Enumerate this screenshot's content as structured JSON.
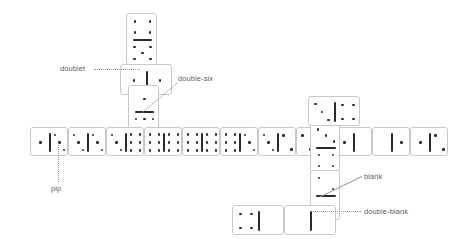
{
  "figure": {
    "background_color": "#ffffff",
    "tile_face_color": "#ffffff",
    "tile_border_color": "#c9c9c9",
    "pip_color": "#2b2b2b",
    "label_color": "#5c5c5c",
    "leader_color": "#9a9a9a"
  },
  "labels": [
    {
      "id": "doublet",
      "text": "doublet",
      "x": 60,
      "y": 64,
      "leader": {
        "x": 94,
        "y": 69,
        "length": 46,
        "angle": 0,
        "style": "dotted"
      }
    },
    {
      "id": "double-six",
      "text": "double-six",
      "x": 178,
      "y": 74,
      "leader": {
        "x": 177,
        "y": 84,
        "length": 46,
        "angle": 140,
        "style": "dotted"
      }
    },
    {
      "id": "pip",
      "text": "pip",
      "x": 51,
      "y": 184,
      "leader": {
        "x": 59,
        "y": 143,
        "length": 39,
        "angle": 90,
        "style": "dotted"
      }
    },
    {
      "id": "blank",
      "text": "blank",
      "x": 364,
      "y": 172,
      "leader": {
        "x": 362,
        "y": 177,
        "length": 47,
        "angle": 154,
        "style": "solid"
      }
    },
    {
      "id": "double-blank",
      "text": "double-blank",
      "x": 364,
      "y": 207,
      "leader": {
        "x": 361,
        "y": 212,
        "length": 48,
        "angle": 180,
        "style": "dotted"
      }
    }
  ],
  "tiles": [
    {
      "id": "t-top-4-5",
      "name": "tile-vertical-four-five",
      "orientation": "vertical",
      "x": 126,
      "y": 13,
      "w": 31,
      "h": 52,
      "a": 4,
      "b": 5
    },
    {
      "id": "t-doublet-1-1",
      "name": "tile-doublet-one-one",
      "orientation": "horizontal",
      "x": 120,
      "y": 64,
      "w": 52,
      "h": 31,
      "a": 1,
      "b": 1
    },
    {
      "id": "t-six-six-v",
      "name": "tile-vertical-double-six",
      "orientation": "vertical",
      "x": 128,
      "y": 85,
      "w": 31,
      "h": 52,
      "a": 1,
      "b": 6
    },
    {
      "id": "t-row-1-3",
      "name": "tile-row-one-three",
      "orientation": "horizontal",
      "x": 30,
      "y": 127,
      "w": 38,
      "h": 29,
      "a": 1,
      "b": 3
    },
    {
      "id": "t-row-3-3",
      "name": "tile-row-three-three",
      "orientation": "horizontal",
      "x": 68,
      "y": 127,
      "w": 38,
      "h": 29,
      "a": 3,
      "b": 3
    },
    {
      "id": "t-row-3-6",
      "name": "tile-row-three-six",
      "orientation": "horizontal",
      "x": 106,
      "y": 127,
      "w": 38,
      "h": 29,
      "a": 3,
      "b": 6
    },
    {
      "id": "t-row-6-6a",
      "name": "tile-row-six-six-a",
      "orientation": "horizontal",
      "x": 144,
      "y": 127,
      "w": 38,
      "h": 29,
      "a": 6,
      "b": 6
    },
    {
      "id": "t-row-6-6b",
      "name": "tile-row-six-six-b",
      "orientation": "horizontal",
      "x": 182,
      "y": 127,
      "w": 38,
      "h": 29,
      "a": 6,
      "b": 6
    },
    {
      "id": "t-row-6-3",
      "name": "tile-row-six-three",
      "orientation": "horizontal",
      "x": 220,
      "y": 127,
      "w": 38,
      "h": 29,
      "a": 6,
      "b": 3
    },
    {
      "id": "t-row-3-2",
      "name": "tile-row-three-two",
      "orientation": "horizontal",
      "x": 258,
      "y": 127,
      "w": 38,
      "h": 29,
      "a": 3,
      "b": 2
    },
    {
      "id": "t-row-2-1",
      "name": "tile-row-two-one",
      "orientation": "horizontal",
      "x": 296,
      "y": 127,
      "w": 38,
      "h": 29,
      "a": 2,
      "b": 1
    },
    {
      "id": "t-row-1-0",
      "name": "tile-row-one-blank",
      "orientation": "horizontal",
      "x": 334,
      "y": 127,
      "w": 38,
      "h": 29,
      "a": 1,
      "b": 0
    },
    {
      "id": "t-row-0-1",
      "name": "tile-row-blank-one",
      "orientation": "horizontal",
      "x": 372,
      "y": 127,
      "w": 38,
      "h": 29,
      "a": 0,
      "b": 1
    },
    {
      "id": "t-row-1-2",
      "name": "tile-row-one-two",
      "orientation": "horizontal",
      "x": 410,
      "y": 127,
      "w": 38,
      "h": 29,
      "a": 1,
      "b": 2
    },
    {
      "id": "t-right-3-4",
      "name": "tile-right-three-four",
      "orientation": "vertical",
      "x": 310,
      "y": 122,
      "w": 30,
      "h": 50,
      "a": 3,
      "b": 4
    },
    {
      "id": "t-right-top-3-4",
      "name": "tile-right-top-three-four",
      "orientation": "horizontal",
      "x": 308,
      "y": 96,
      "w": 52,
      "h": 30,
      "a": 3,
      "b": 4
    },
    {
      "id": "t-right-2-0",
      "name": "tile-right-two-blank",
      "orientation": "vertical",
      "x": 310,
      "y": 170,
      "w": 30,
      "h": 50,
      "a": 2,
      "b": 0
    },
    {
      "id": "t-bottom-4-0",
      "name": "tile-bottom-four-blank",
      "orientation": "horizontal",
      "x": 232,
      "y": 205,
      "w": 52,
      "h": 30,
      "a": 4,
      "b": 0
    },
    {
      "id": "t-bottom-0-0",
      "name": "tile-bottom-double-blank",
      "orientation": "horizontal",
      "x": 284,
      "y": 205,
      "w": 52,
      "h": 30,
      "a": 0,
      "b": 0
    }
  ]
}
